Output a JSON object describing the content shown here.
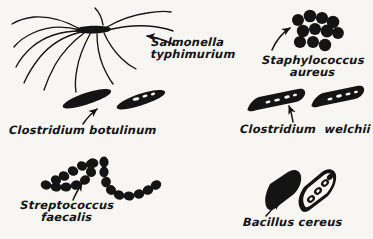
{
  "figure": {
    "background_color": "#f7f6f3",
    "ink_color": "#141414",
    "width": 373,
    "height": 239
  },
  "specimens": [
    {
      "id": "salmonella-typhimurium",
      "name_line1": "Salmonella",
      "name_line2": "typhimurium",
      "morphology": "peritrichous flagellated rod",
      "cell_count": 1,
      "position": "top-left"
    },
    {
      "id": "staphylococcus-aureus",
      "name_line1": "Staphylococcus",
      "name_line2": "aureus",
      "morphology": "grape-like cluster of cocci",
      "cell_count": 11,
      "position": "top-right"
    },
    {
      "id": "clostridium-botulinum",
      "name_line1": "Clostridium botulinum",
      "name_line2": "",
      "morphology": "tapered spore-bearing rods",
      "cell_count": 2,
      "position": "middle-left"
    },
    {
      "id": "clostridium-welchii",
      "name_line1": "Clostridium  welchii",
      "name_line2": "",
      "morphology": "thick blunt-ended rods",
      "cell_count": 2,
      "position": "middle-right"
    },
    {
      "id": "streptococcus-faecalis",
      "name_line1": "Streptococcus",
      "name_line2": "faecalis",
      "morphology": "chains of cocci",
      "cell_count": 2,
      "position": "bottom-left"
    },
    {
      "id": "bacillus-cereus",
      "name_line1": "Bacillus cereus",
      "name_line2": "",
      "morphology": "large rods, one with internal spore chain",
      "cell_count": 2,
      "position": "bottom-right"
    }
  ],
  "arrows": [
    {
      "id": "arrow-salmonella",
      "points_to": "salmonella-typhimurium",
      "direction": "left"
    },
    {
      "id": "arrow-staphylococcus",
      "points_to": "staphylococcus-aureus",
      "direction": "up"
    },
    {
      "id": "arrow-botulinum",
      "points_to": "clostridium-botulinum",
      "direction": "up-right"
    },
    {
      "id": "arrow-welchii",
      "points_to": "clostridium-welchii",
      "direction": "up"
    },
    {
      "id": "arrow-streptococcus",
      "points_to": "streptococcus-faecalis",
      "direction": "up"
    },
    {
      "id": "arrow-cereus",
      "points_to": "bacillus-cereus",
      "direction": "up-right"
    }
  ]
}
